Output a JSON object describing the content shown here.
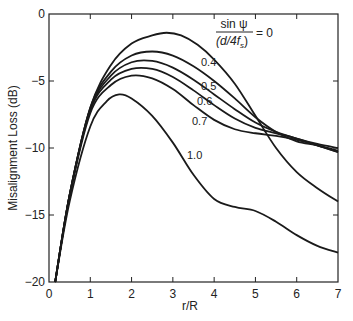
{
  "chart_data": {
    "type": "line",
    "title": "",
    "xlabel": "r/R",
    "ylabel": "Misalignment Loss (dB)",
    "xlim": [
      0,
      7
    ],
    "ylim": [
      -20,
      0
    ],
    "xticks": [
      0,
      1,
      2,
      3,
      4,
      5,
      6,
      7
    ],
    "yticks": [
      0,
      -5,
      -10,
      -15,
      -20
    ],
    "grid": false,
    "legend_annotation": {
      "numerator": "sin ψ",
      "denominator": "(d/4f",
      "denominator_sub": "s",
      "denominator_close": ")",
      "equals": "= 0"
    },
    "series": [
      {
        "name": "0",
        "label": "",
        "x": [
          0.15,
          0.5,
          1.0,
          1.5,
          2.0,
          2.5,
          2.85,
          3.2,
          3.6,
          4.0,
          4.5,
          5.0,
          5.5,
          6.0,
          6.5,
          7.0
        ],
        "y": [
          -20,
          -13.5,
          -7.0,
          -3.8,
          -2.2,
          -1.6,
          -1.4,
          -1.6,
          -2.3,
          -3.4,
          -5.2,
          -7.6,
          -10.0,
          -11.8,
          -13.0,
          -14.0
        ]
      },
      {
        "name": "0.4",
        "label": "0.4",
        "x": [
          0.15,
          0.5,
          1.0,
          1.5,
          2.0,
          2.5,
          3.0,
          3.5,
          4.0,
          4.5,
          5.0,
          5.5,
          6.0,
          6.5,
          7.0
        ],
        "y": [
          -20,
          -13.5,
          -7.0,
          -4.3,
          -3.1,
          -2.8,
          -3.1,
          -3.9,
          -5.0,
          -6.3,
          -7.7,
          -8.8,
          -9.5,
          -9.8,
          -10.2
        ]
      },
      {
        "name": "0.5",
        "label": "0.5",
        "x": [
          0.15,
          0.5,
          1.0,
          1.5,
          2.0,
          2.5,
          3.0,
          3.5,
          4.0,
          4.5,
          5.0,
          5.5,
          6.0,
          6.5,
          7.0
        ],
        "y": [
          -20,
          -13.5,
          -7.1,
          -4.6,
          -3.6,
          -3.5,
          -4.0,
          -4.9,
          -6.0,
          -7.1,
          -8.1,
          -8.8,
          -9.3,
          -9.7,
          -10.0
        ]
      },
      {
        "name": "0.6",
        "label": "0.6",
        "x": [
          0.15,
          0.5,
          1.0,
          1.5,
          2.0,
          2.5,
          3.0,
          3.5,
          4.0,
          4.5,
          5.0,
          5.5,
          6.0,
          6.5,
          7.0
        ],
        "y": [
          -20,
          -13.5,
          -7.2,
          -4.9,
          -4.1,
          -4.1,
          -4.7,
          -5.7,
          -6.8,
          -7.8,
          -8.5,
          -8.9,
          -9.3,
          -9.8,
          -10.3
        ]
      },
      {
        "name": "0.7",
        "label": "0.7",
        "x": [
          0.15,
          0.5,
          1.0,
          1.5,
          2.0,
          2.5,
          3.0,
          3.5,
          4.0,
          4.5,
          5.0,
          5.5,
          6.0,
          6.5,
          7.0
        ],
        "y": [
          -20,
          -13.6,
          -7.4,
          -5.3,
          -4.6,
          -4.8,
          -5.6,
          -6.8,
          -7.9,
          -8.6,
          -8.9,
          -9.1,
          -9.4,
          -9.8,
          -10.3
        ]
      },
      {
        "name": "1.0",
        "label": "1.0",
        "x": [
          0.15,
          0.5,
          1.0,
          1.4,
          1.7,
          2.0,
          2.5,
          3.0,
          3.5,
          4.0,
          4.5,
          5.0,
          5.5,
          6.0,
          6.5,
          7.0
        ],
        "y": [
          -20,
          -14.0,
          -8.4,
          -6.5,
          -6.0,
          -6.3,
          -7.6,
          -9.6,
          -12.0,
          -13.8,
          -14.4,
          -14.7,
          -15.5,
          -16.5,
          -17.3,
          -17.8
        ]
      }
    ]
  },
  "labels": {
    "x_ticks": [
      "0",
      "1",
      "2",
      "3",
      "4",
      "5",
      "6",
      "7"
    ],
    "y_ticks": [
      "0",
      "−5",
      "−10",
      "−15",
      "−20"
    ]
  }
}
